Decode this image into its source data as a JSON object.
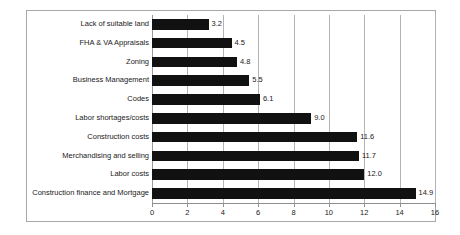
{
  "chart_data": {
    "type": "bar",
    "orientation": "horizontal",
    "title": "",
    "subtitle": "",
    "xlabel": "",
    "ylabel": "",
    "categories": [
      "Lack of suitable land",
      "FHA & VA Appraisals",
      "Zoning",
      "Business Management",
      "Codes",
      "Labor shortages/costs",
      "Construction costs",
      "Merchandising and selling",
      "Labor costs",
      "Construction finance and Mortgage"
    ],
    "values": [
      3.2,
      4.5,
      4.8,
      5.5,
      6.1,
      9.0,
      11.6,
      11.7,
      12.0,
      14.9
    ],
    "value_labels": [
      "3.2",
      "4.5",
      "4.8",
      "5.5",
      "6.1",
      "9.0",
      "11.6",
      "11.7",
      "12.0",
      "14.9"
    ],
    "xlim": [
      0,
      16
    ],
    "xticks": [
      0,
      2,
      4,
      6,
      8,
      10,
      12,
      14,
      16
    ],
    "xtick_labels": [
      "0",
      "2",
      "4",
      "6",
      "8",
      "10",
      "12",
      "14",
      "16"
    ],
    "grid": "vertical",
    "legend": "none",
    "series": [
      {
        "name": "",
        "values": [
          3.2,
          4.5,
          4.8,
          5.5,
          6.1,
          9.0,
          11.6,
          11.7,
          12.0,
          14.9
        ]
      }
    ],
    "colors": {
      "bar": "#111111",
      "gridline": "#b4b4b4",
      "frame": "#a8a8a8",
      "text": "#1a1a1a",
      "background": "#ffffff"
    }
  }
}
